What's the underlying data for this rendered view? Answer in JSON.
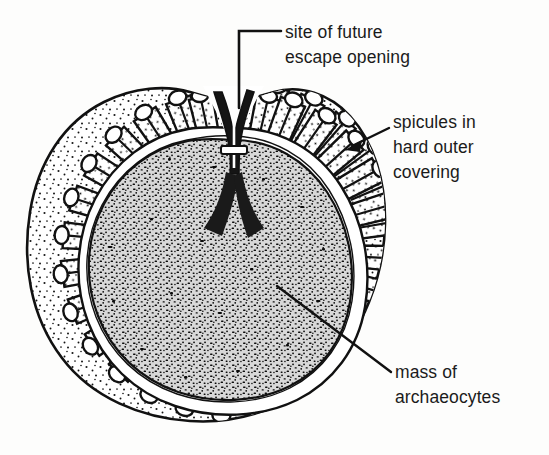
{
  "figure": {
    "type": "scientific-line-drawing",
    "background_color": "#fdfdfc",
    "ink_color": "#111111",
    "outer_covering_fill": "#ffffff",
    "inner_mass_fill": "#d8d8d8",
    "inner_mass_stipple_color": "#101010"
  },
  "labels": {
    "escape_opening": {
      "line1": "site of future",
      "line2": "escape opening"
    },
    "spicules": {
      "line1": "spicules in",
      "line2": "hard outer",
      "line3": "covering"
    },
    "archaeocytes": {
      "line1": "mass of",
      "line2": "archaeocytes"
    }
  }
}
